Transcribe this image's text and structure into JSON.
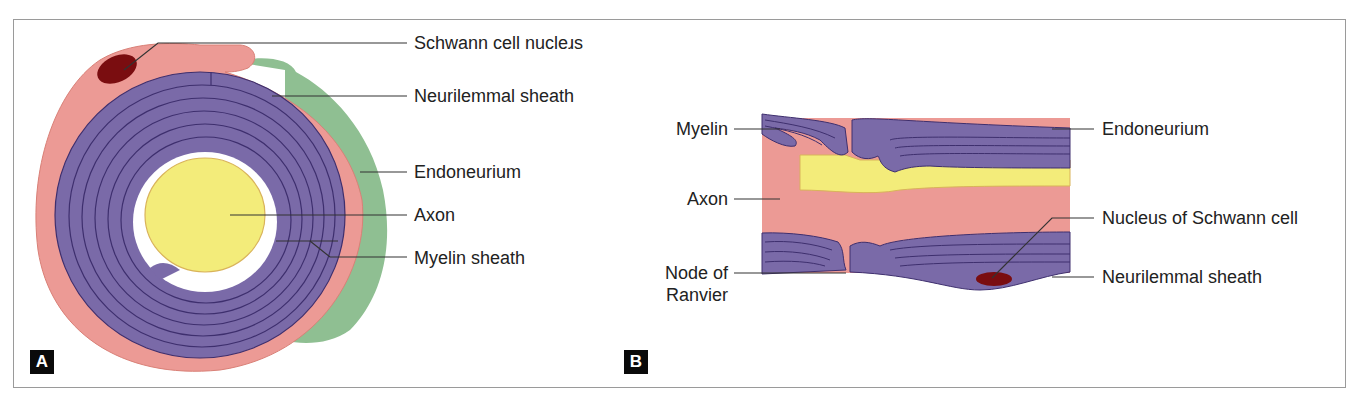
{
  "figure": {
    "panels": [
      {
        "id": "A",
        "tag": "A",
        "title": "Transverse section of myelinated nerve fibre",
        "labels": [
          {
            "key": "schwann_nucleus",
            "text": "Schwann cell nucleɹs"
          },
          {
            "key": "neurilemmal_sheath",
            "text": "Neurilemmal sheath"
          },
          {
            "key": "endoneurium",
            "text": "Endoneurium"
          },
          {
            "key": "axon",
            "text": "Axon"
          },
          {
            "key": "myelin_sheath",
            "text": "Myelin sheath"
          }
        ]
      },
      {
        "id": "B",
        "tag": "B",
        "title": "Longitudinal section of myelinated nerve fibre",
        "labels_left": [
          {
            "key": "myelin",
            "text": "Myelin"
          },
          {
            "key": "axon",
            "text": "Axon"
          },
          {
            "key": "node_line1",
            "text": "Node of"
          },
          {
            "key": "node_line2",
            "text": "Ranvier"
          }
        ],
        "labels_right": [
          {
            "key": "endoneurium",
            "text": "Endoneurium"
          },
          {
            "key": "nucleus_schwann",
            "text": "Nucleus of Schwann cell"
          },
          {
            "key": "neurilemmal_sheath",
            "text": "Neurilemmal sheath"
          }
        ]
      }
    ],
    "colors": {
      "schwann_cytoplasm": "#ec9a95",
      "myelin": "#7a6aa8",
      "myelin_line": "#3e2f6e",
      "axon": "#f3ec7a",
      "endoneurium": "#8fbf92",
      "nucleus": "#7a0d10",
      "leader": "#333333"
    }
  }
}
